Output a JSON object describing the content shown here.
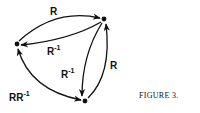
{
  "figure": {
    "caption": "FIGURE 3.",
    "nodes": [
      {
        "id": "left",
        "x": 17,
        "y": 44
      },
      {
        "id": "top-right",
        "x": 104,
        "y": 19
      },
      {
        "id": "bottom",
        "x": 85,
        "y": 101
      }
    ],
    "edges": [
      {
        "from": "left",
        "to": "top-right",
        "label": "R"
      },
      {
        "from": "top-right",
        "to": "left",
        "label_base": "R",
        "label_sup": "-1"
      },
      {
        "from": "top-right",
        "to": "bottom",
        "label_base": "R",
        "label_sup": "-1"
      },
      {
        "from": "bottom",
        "to": "top-right",
        "label": "R"
      },
      {
        "from": "bottom",
        "to": "left",
        "label_base": "RR",
        "label_sup": "-1",
        "bidirectional": true
      }
    ],
    "labels": {
      "top_arc": "R",
      "mid_arc_base": "R",
      "mid_arc_sup": "-1",
      "inner_right_base": "R",
      "inner_right_sup": "-1",
      "outer_right": "R",
      "bottom_left_base": "RR",
      "bottom_left_sup": "-1"
    },
    "colors": {
      "ink": "#111111",
      "background": "#ffffff"
    }
  }
}
